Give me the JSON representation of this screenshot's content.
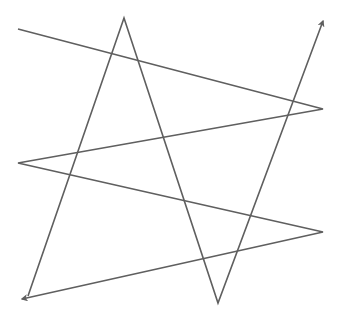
{
  "diagram": {
    "background": "#ffffff",
    "stroke_color": "#5f5f5f",
    "stroke_width": 1.6,
    "paths": [
      {
        "id": "zigzag",
        "points": [
          [
            18,
            29
          ],
          [
            323,
            109
          ],
          [
            18,
            163
          ],
          [
            323,
            232
          ],
          [
            22,
            299
          ]
        ],
        "arrow_end": true
      },
      {
        "id": "peaks",
        "points": [
          [
            28,
            296
          ],
          [
            124,
            18
          ],
          [
            218,
            303
          ],
          [
            323,
            21
          ]
        ],
        "arrow_end": true
      }
    ]
  }
}
